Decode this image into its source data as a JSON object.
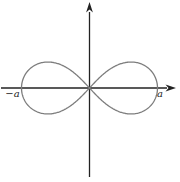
{
  "figure": {
    "labels": {
      "left_intercept": "−a",
      "right_intercept": "a"
    }
  },
  "chart_data": {
    "type": "line",
    "title": "",
    "xlabel": "",
    "ylabel": "",
    "curve_name": "lemniscate of Bernoulli",
    "equation": "(x² + y²)² = a²(x² − y²)",
    "parametric": "x = a·cos(t)/(1+sin²(t)), y = a·sin(t)·cos(t)/(1+sin²(t))",
    "x_intercept_labels": [
      "−a",
      "a"
    ],
    "key_points_in_units_of_a": [
      [
        -1,
        0
      ],
      [
        0,
        0
      ],
      [
        1,
        0
      ]
    ],
    "x_range_units_of_a": [
      -1,
      1
    ],
    "y_range_units_of_a": [
      -0.38,
      0.38
    ],
    "grid": false,
    "legend": false,
    "layout": {
      "center_px": [
        89.5,
        88
      ],
      "a_px": 68,
      "y_scale": 1.08,
      "x_axis_px": {
        "x1": 1,
        "x2": 167,
        "arrow_tip_x": 176
      },
      "y_axis_px": {
        "y1": 177,
        "y2": 12,
        "arrow_tip_y": 2
      }
    },
    "colors": {
      "axis": "#222222",
      "curve": "#7d7d7d",
      "label": "#222222"
    }
  }
}
